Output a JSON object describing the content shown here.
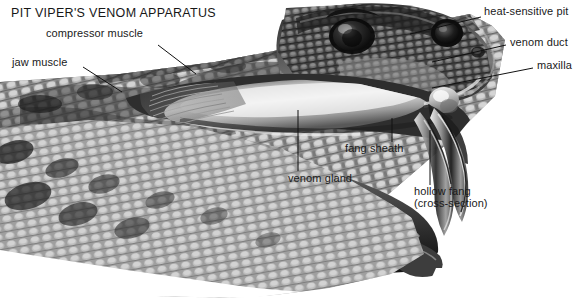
{
  "figure": {
    "title": "PIT VIPER'S VENOM APPARATUS",
    "style": "grayscale airbrush anatomical illustration",
    "background_color": "#ffffff",
    "text_color": "#1a1a1a",
    "leader_line_color": "#111111"
  },
  "labels": [
    {
      "id": "compressor-muscle",
      "text": "compressor muscle",
      "x": 46,
      "y": 33,
      "anchor": "left"
    },
    {
      "id": "jaw-muscle",
      "text": "jaw muscle",
      "x": 12,
      "y": 62,
      "anchor": "left"
    },
    {
      "id": "heat-sensitive-pit",
      "text": "heat-sensitive pit",
      "x": 484,
      "y": 10,
      "anchor": "left"
    },
    {
      "id": "venom-duct",
      "text": "venom duct",
      "x": 510,
      "y": 41,
      "anchor": "left"
    },
    {
      "id": "maxilla",
      "text": "maxilla",
      "x": 537,
      "y": 64,
      "anchor": "left"
    },
    {
      "id": "fang-sheath",
      "text": "fang sheath",
      "x": 345,
      "y": 147,
      "anchor": "left"
    },
    {
      "id": "venom-gland",
      "text": "venom gland",
      "x": 288,
      "y": 177,
      "anchor": "left"
    },
    {
      "id": "hollow-fang",
      "text": "hollow fang",
      "x": 414,
      "y": 190,
      "anchor": "left"
    },
    {
      "id": "hollow-fang-sub",
      "text": "(cross-section)",
      "x": 414,
      "y": 202,
      "anchor": "left"
    }
  ],
  "anatomy_parts": [
    "compressor muscle",
    "jaw muscle",
    "venom gland",
    "venom duct",
    "fang sheath",
    "hollow fang",
    "maxilla",
    "heat-sensitive pit"
  ]
}
